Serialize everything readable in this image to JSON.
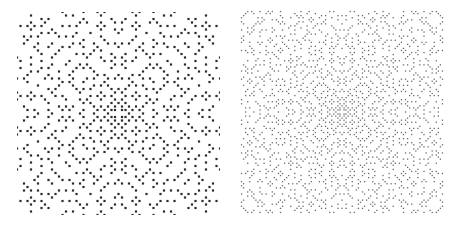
{
  "figure": {
    "background": "#ffffff",
    "panels": [
      {
        "id": "left",
        "description": "Gaussian-prime style dot lattice, coarse dots, dark",
        "x": 17,
        "y": 12,
        "size": 203,
        "radius": 26,
        "dot_size": 2.2,
        "cell": 3.5,
        "color": "#2a2a2a"
      },
      {
        "id": "right",
        "description": "Gaussian-prime style dot lattice, fine dots, gray",
        "x": 240,
        "y": 10,
        "size": 204,
        "radius": 0,
        "dot_size": 1.3,
        "cell": 2.05,
        "color": "#6a6a6a"
      }
    ]
  }
}
